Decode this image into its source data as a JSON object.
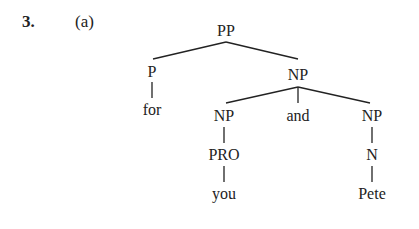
{
  "exercise": {
    "number": "3.",
    "part": "(a)"
  },
  "tree": {
    "root": "PP",
    "nodes": {
      "pp": "PP",
      "p": "P",
      "for": "for",
      "np_top": "NP",
      "np_left": "NP",
      "and": "and",
      "np_right": "NP",
      "pro": "PRO",
      "you": "you",
      "n": "N",
      "pete": "Pete"
    },
    "structure": "[PP [P for] [NP [NP [PRO you]] and [NP [N Pete]]]]"
  }
}
